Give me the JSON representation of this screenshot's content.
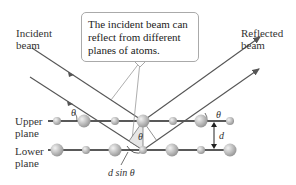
{
  "labels": {
    "incident_beam": [
      "Incident",
      "beam"
    ],
    "reflected_beam": [
      "Reflected",
      "beam"
    ],
    "upper_plane": [
      "Upper",
      "plane"
    ],
    "lower_plane": [
      "Lower",
      "plane"
    ],
    "callout": [
      "The incident beam can",
      "reflect from different",
      "planes of atoms."
    ],
    "theta": "θ",
    "d": "d",
    "d_sin_theta": "d sin θ"
  },
  "colors": {
    "beam": "#555555",
    "plane_line": "#222222",
    "atom": "#b8b8b8",
    "callout_border": "#aaaaaa"
  },
  "planes": {
    "upper_y": 121,
    "lower_y": 150,
    "upper_atoms": [
      [
        57,
        "s"
      ],
      [
        84,
        "l"
      ],
      [
        115,
        "s"
      ],
      [
        143,
        "l"
      ],
      [
        173,
        "s"
      ],
      [
        201,
        "l"
      ],
      [
        230,
        "s"
      ]
    ],
    "lower_atoms": [
      [
        57,
        "l"
      ],
      [
        86,
        "s"
      ],
      [
        115,
        "l"
      ],
      [
        143,
        "s"
      ],
      [
        172,
        "l"
      ],
      [
        201,
        "s"
      ],
      [
        230,
        "l"
      ]
    ]
  }
}
